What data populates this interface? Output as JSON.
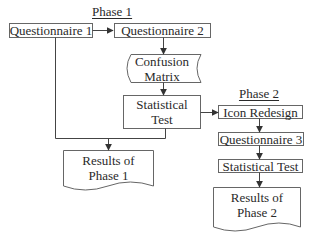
{
  "diagram": {
    "type": "flowchart",
    "phases": [
      {
        "id": "phase1",
        "label": "Phase 1"
      },
      {
        "id": "phase2",
        "label": "Phase 2"
      }
    ],
    "nodes": {
      "questionnaire1": {
        "label": "Questionnaire 1",
        "shape": "process"
      },
      "questionnaire2": {
        "label": "Questionnaire 2",
        "shape": "process"
      },
      "confusion_matrix": {
        "line1": "Confusion",
        "line2": "Matrix",
        "shape": "stored-data"
      },
      "statistical_test1": {
        "line1": "Statistical",
        "line2": "Test",
        "shape": "process"
      },
      "results_phase1": {
        "line1": "Results of",
        "line2": "Phase 1",
        "shape": "document"
      },
      "icon_redesign": {
        "label": "Icon Redesign",
        "shape": "process"
      },
      "questionnaire3": {
        "label": "Questionnaire 3",
        "shape": "process"
      },
      "statistical_test2": {
        "label": "Statistical Test",
        "shape": "process"
      },
      "results_phase2": {
        "line1": "Results of",
        "line2": "Phase 2",
        "shape": "document"
      }
    },
    "edges": [
      [
        "Questionnaire 1",
        "Questionnaire 2"
      ],
      [
        "Questionnaire 2",
        "Confusion Matrix"
      ],
      [
        "Confusion Matrix",
        "Statistical Test"
      ],
      [
        "Questionnaire 1",
        "Results of Phase 1"
      ],
      [
        "Statistical Test",
        "Results of Phase 1"
      ],
      [
        "Statistical Test",
        "Icon Redesign"
      ],
      [
        "Icon Redesign",
        "Questionnaire 3"
      ],
      [
        "Questionnaire 3",
        "Statistical Test (Phase 2)"
      ],
      [
        "Statistical Test (Phase 2)",
        "Results of Phase 2"
      ]
    ],
    "colors": {
      "stroke": "#555555",
      "text": "#2a2a2a",
      "background": "#ffffff"
    }
  }
}
